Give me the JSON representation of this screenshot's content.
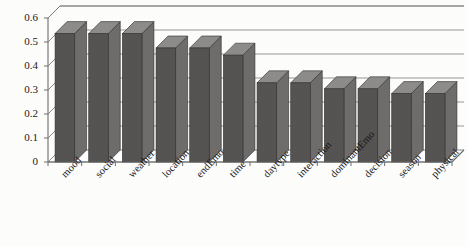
{
  "chart_data": {
    "type": "bar",
    "title": "",
    "subtitle": "",
    "xlabel": "",
    "ylabel": "",
    "ylim": [
      0,
      0.6
    ],
    "ytick_labels": [
      "0.6",
      "0.5",
      "0.4",
      "0.3",
      "0.2",
      "0.1",
      "0"
    ],
    "ytick_values": [
      0.6,
      0.5,
      0.4,
      0.3,
      0.2,
      0.1,
      0
    ],
    "grid": true,
    "legend": null,
    "style": "3d-bar",
    "bar_color": "#555453",
    "categories": [
      "mood",
      "social",
      "weather",
      "location",
      "endEmo",
      "time",
      "daytype",
      "interaction",
      "dominantEmo",
      "decision",
      "season",
      "physical"
    ],
    "values": [
      0.535,
      0.535,
      0.535,
      0.475,
      0.475,
      0.445,
      0.33,
      0.33,
      0.305,
      0.305,
      0.285,
      0.285
    ]
  }
}
